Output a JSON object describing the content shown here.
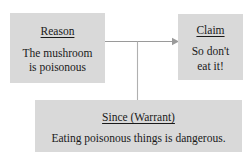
{
  "diagram": {
    "background_color": "#ffffff",
    "box_fill_color": "#d9d9d9",
    "text_color": "#1a1a1a",
    "connector_color": "#9a9a9a",
    "nodes": [
      {
        "id": "reason",
        "heading": "Reason",
        "body_lines": [
          "The mushroom",
          "is poisonous"
        ],
        "body": "The mushroom is poisonous"
      },
      {
        "id": "claim",
        "heading": "Claim",
        "body_lines": [
          "So don't",
          "eat it!"
        ],
        "body": "So don't eat it!"
      },
      {
        "id": "warrant",
        "heading": "Since (Warrant)",
        "body_lines": [
          "Eating poisonous things is dangerous."
        ],
        "body": "Eating poisonous things is dangerous."
      }
    ],
    "connectors": [
      {
        "id": "reason-to-claim",
        "from": "reason",
        "to": "claim",
        "style": "arrow",
        "direction": "right"
      },
      {
        "id": "warrant-to-link",
        "from": "warrant",
        "to": "reason-to-claim",
        "style": "line",
        "direction": "up"
      }
    ]
  }
}
